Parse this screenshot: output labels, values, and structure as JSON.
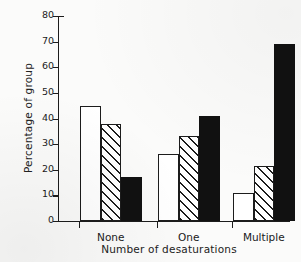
{
  "chart_data": {
    "type": "bar",
    "title": "",
    "subtitle": "",
    "xlabel": "Number of desaturations",
    "ylabel": "Percentage of group",
    "categories": [
      "None",
      "One",
      "Multiple"
    ],
    "series": [
      {
        "name": "open",
        "fill": "white",
        "values": [
          45,
          26,
          11
        ]
      },
      {
        "name": "hatched",
        "fill": "diagonal-hatch",
        "values": [
          38,
          33,
          21.5
        ]
      },
      {
        "name": "solid",
        "fill": "black",
        "values": [
          17,
          41,
          69
        ]
      }
    ],
    "ylim": [
      0,
      80
    ],
    "yticks": [
      0,
      10,
      20,
      30,
      40,
      50,
      60,
      70,
      80
    ],
    "ytick_labels": [
      "0",
      "10",
      "20",
      "30",
      "40",
      "50",
      "60",
      "70",
      "80"
    ],
    "grid": false,
    "legend": "none",
    "colors": {
      "axis": "#1c1c1c",
      "open_fill": "#ffffff",
      "hatch_fill": "#ffffff",
      "hatch_line": "#1c1c1c",
      "solid_fill": "#111111",
      "background": "#fbfbfa"
    }
  }
}
